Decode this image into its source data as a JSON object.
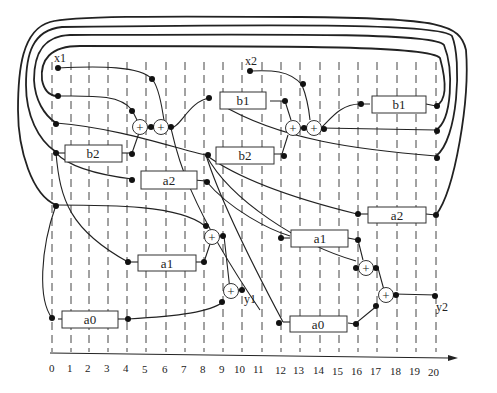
{
  "diagram": {
    "type": "scheduled-dataflow-graph",
    "inputs": [
      {
        "id": "x1",
        "label": "x1"
      },
      {
        "id": "x2",
        "label": "x2"
      }
    ],
    "outputs": [
      {
        "id": "y1",
        "label": "y1"
      },
      {
        "id": "y2",
        "label": "y2"
      }
    ],
    "multipliers": [
      {
        "id": "m_b1_1",
        "label": "b1"
      },
      {
        "id": "m_b2_1",
        "label": "b2"
      },
      {
        "id": "m_a2_1",
        "label": "a2"
      },
      {
        "id": "m_a1_1",
        "label": "a1"
      },
      {
        "id": "m_a0_1",
        "label": "a0"
      },
      {
        "id": "m_b1_2",
        "label": "b1"
      },
      {
        "id": "m_b2_2",
        "label": "b2"
      },
      {
        "id": "m_a2_2",
        "label": "a2"
      },
      {
        "id": "m_a1_2",
        "label": "a1"
      },
      {
        "id": "m_a0_2",
        "label": "a0"
      }
    ],
    "adder_symbol": "+",
    "axis": {
      "ticks": [
        "0",
        "1",
        "2",
        "3",
        "4",
        "5",
        "6",
        "7",
        "8",
        "9",
        "10",
        "11",
        "12",
        "13",
        "14",
        "15",
        "16",
        "17",
        "18",
        "19",
        "20"
      ]
    }
  }
}
